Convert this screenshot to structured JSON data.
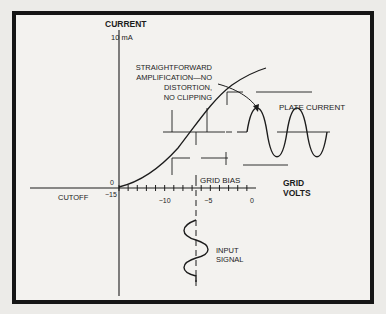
{
  "figure": {
    "y_axis_title": "CURRENT",
    "y_axis_max_label": "10 mA",
    "x_axis_title_line1": "GRID",
    "x_axis_title_line2": "VOLTS",
    "origin_y_label": "0",
    "cutoff_label": "CUTOFF",
    "grid_bias_label": "GRID BIAS",
    "plate_current_label": "PLATE CURRENT",
    "input_signal_line1": "INPUT",
    "input_signal_line2": "SIGNAL",
    "annotation_lines": [
      "STRAIGHTFORWARD",
      "AMPLIFICATION—NO",
      "DISTORTION,",
      "NO CLIPPING"
    ],
    "x_ticks": [
      {
        "value": -15,
        "label": "−15"
      },
      {
        "value": -10,
        "label": "−10"
      },
      {
        "value": -5,
        "label": "−5"
      },
      {
        "value": 0,
        "label": "0"
      }
    ],
    "grid_bias_volts": -7.5
  }
}
